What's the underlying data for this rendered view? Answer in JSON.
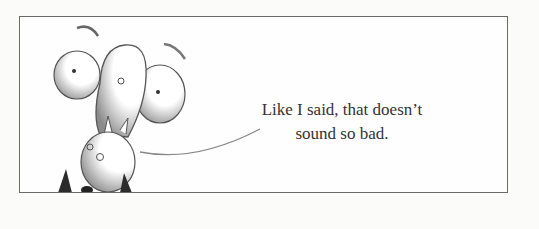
{
  "panel": {
    "caption_line1": "Like I said, that doesn’t",
    "caption_line2": "sound so bad.",
    "border_color": "#6a6a6a",
    "background": "#fefefe"
  },
  "illustration": {
    "subject": "cartoon-character-upside-down-with-bulging-eyes",
    "speech_tail": "curved-line-from-character-to-caption"
  }
}
